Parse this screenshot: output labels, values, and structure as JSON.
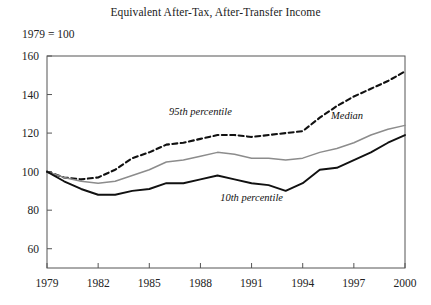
{
  "chart_data": {
    "type": "line",
    "title": "Equivalent After-Tax, After-Transfer Income",
    "subtitle": "1979 = 100",
    "xlabel": "",
    "ylabel": "",
    "xlim": [
      1979,
      2000
    ],
    "ylim": [
      50,
      160
    ],
    "grid": false,
    "legend_position": "inline-annotations",
    "xticks": [
      "1979",
      "1982",
      "1985",
      "1988",
      "1991",
      "1994",
      "1997",
      "2000"
    ],
    "yticks": [
      "60",
      "80",
      "100",
      "120",
      "140",
      "160"
    ],
    "x": [
      1979,
      1980,
      1981,
      1982,
      1983,
      1984,
      1985,
      1986,
      1987,
      1988,
      1989,
      1990,
      1991,
      1992,
      1993,
      1994,
      1995,
      1996,
      1997,
      1998,
      1999,
      2000
    ],
    "series": [
      {
        "name": "95th percentile",
        "style": "dashed",
        "color": "#111111",
        "label_x": 1988.0,
        "label_y": 129.5,
        "values": [
          100,
          97,
          96,
          97,
          101,
          107,
          110,
          114,
          115,
          117,
          119,
          119,
          118,
          119,
          120,
          121,
          128,
          134,
          139,
          143,
          147,
          152
        ]
      },
      {
        "name": "Median",
        "style": "solid",
        "color": "#8c8c8c",
        "label_x": 1996.6,
        "label_y": 127.5,
        "values": [
          100,
          97,
          95,
          94,
          95,
          98,
          101,
          105,
          106,
          108,
          110,
          109,
          107,
          107,
          106,
          107,
          110,
          112,
          115,
          119,
          122,
          124
        ]
      },
      {
        "name": "10th percentile",
        "style": "solid",
        "color": "#111111",
        "label_x": 1991.0,
        "label_y": 85.0,
        "values": [
          100,
          95,
          91,
          88,
          88,
          90,
          91,
          94,
          94,
          96,
          98,
          96,
          94,
          93,
          90,
          94,
          101,
          102,
          106,
          110,
          115,
          119
        ]
      }
    ]
  }
}
